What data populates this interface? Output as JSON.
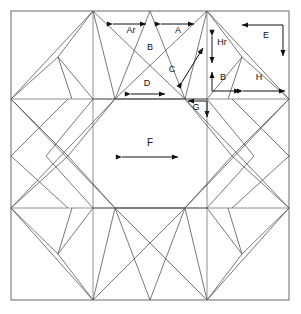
{
  "diagram": {
    "type": "quilt-block-pattern",
    "colors": {
      "piece_line": "#555555",
      "frame_line": "#777777",
      "dimension_line": "#111111",
      "background": "#ffffff"
    },
    "frame": {
      "x": 11,
      "y": 11,
      "width": 278,
      "height": 289
    },
    "grid": {
      "vertical_x": [
        11,
        93,
        150,
        207,
        289
      ],
      "horizontal_y": [
        11,
        99,
        156,
        208,
        300
      ]
    }
  },
  "labels": [
    {
      "id": "label-ar",
      "text": "Ar",
      "x": 131,
      "y": 33,
      "size": "small"
    },
    {
      "id": "label-a",
      "text": "A",
      "x": 178,
      "y": 33,
      "size": "small"
    },
    {
      "id": "label-b-top",
      "text": "B",
      "x": 150,
      "y": 50,
      "size": "small"
    },
    {
      "id": "label-c",
      "text": "C",
      "x": 172,
      "y": 72,
      "size": "small"
    },
    {
      "id": "label-d",
      "text": "D",
      "x": 147,
      "y": 86,
      "size": "small"
    },
    {
      "id": "label-e",
      "text": "E",
      "x": 266,
      "y": 38,
      "size": "small"
    },
    {
      "id": "label-hr",
      "text": "Hr",
      "x": 222,
      "y": 45,
      "size": "small"
    },
    {
      "id": "label-b-right",
      "text": "B",
      "x": 223,
      "y": 80,
      "size": "small"
    },
    {
      "id": "label-h",
      "text": "H",
      "x": 259,
      "y": 80,
      "size": "small"
    },
    {
      "id": "label-g",
      "text": "G",
      "x": 196,
      "y": 110,
      "size": "small"
    },
    {
      "id": "label-f",
      "text": "F",
      "x": 150,
      "y": 146,
      "size": "big"
    }
  ],
  "dimension_arrows": [
    {
      "id": "arrow-ar",
      "kind": "double-horizontal",
      "x1": 113,
      "y1": 24,
      "x2": 146,
      "y2": 24
    },
    {
      "id": "arrow-a",
      "kind": "double-horizontal",
      "x1": 161,
      "y1": 24,
      "x2": 194,
      "y2": 24
    },
    {
      "id": "arrow-c",
      "kind": "double-diagonal",
      "x1": 182,
      "y1": 82,
      "x2": 203,
      "y2": 48
    },
    {
      "id": "arrow-d",
      "kind": "double-horizontal",
      "x1": 131,
      "y1": 94,
      "x2": 165,
      "y2": 94
    },
    {
      "id": "arrow-e",
      "kind": "elbow-left-down",
      "x1": 283,
      "y1": 25,
      "x2": 242,
      "y2": 25,
      "x3": 283,
      "y3": 56
    },
    {
      "id": "arrow-hr",
      "kind": "double-vertical",
      "x1": 212,
      "y1": 36,
      "x2": 212,
      "y2": 63
    },
    {
      "id": "arrow-b-right",
      "kind": "elbow-up-right",
      "x1": 212,
      "y1": 91,
      "x2": 212,
      "y2": 72,
      "x3": 240,
      "y3": 91
    },
    {
      "id": "arrow-h",
      "kind": "double-horizontal",
      "x1": 243,
      "y1": 91,
      "x2": 285,
      "y2": 91
    },
    {
      "id": "arrow-g",
      "kind": "elbow-left-down",
      "x1": 207,
      "y1": 101,
      "x2": 188,
      "y2": 101,
      "x3": 207,
      "y3": 117
    },
    {
      "id": "arrow-f",
      "kind": "double-horizontal",
      "x1": 122,
      "y1": 157,
      "x2": 178,
      "y2": 157
    }
  ],
  "piece_names": [
    "A",
    "Ar",
    "B",
    "C",
    "D",
    "E",
    "F",
    "G",
    "H",
    "Hr"
  ]
}
